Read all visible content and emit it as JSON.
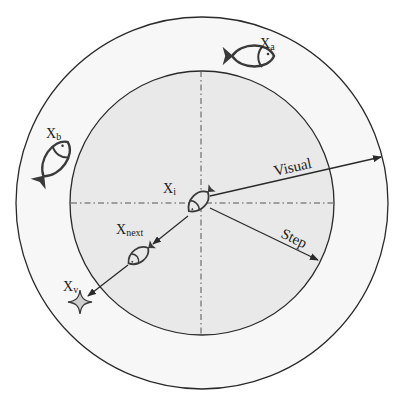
{
  "diagram": {
    "type": "fish-swarm-visual-step-diagram",
    "colors": {
      "background": "#ffffff",
      "outer_ring_fill": "#f7f7f7",
      "inner_disk_fill": "#e9e9e9",
      "stroke": "#2a2a2a",
      "star_fill": "#cfcfcf"
    },
    "circles": {
      "center": [
        202,
        203
      ],
      "outer_radius": 186,
      "inner_radius": 132
    },
    "labels": {
      "xa": {
        "main": "X",
        "sub": "a"
      },
      "xb": {
        "main": "X",
        "sub": "b"
      },
      "xi": {
        "main": "X",
        "sub": "i"
      },
      "xnext": {
        "main": "X",
        "sub": "next"
      },
      "xv": {
        "main": "X",
        "sub": "v"
      },
      "visual": "Visual",
      "step": "Step"
    },
    "fish": [
      {
        "id": "fish-xa",
        "label": "Xa"
      },
      {
        "id": "fish-xb",
        "label": "Xb"
      },
      {
        "id": "fish-xi",
        "label": "Xi"
      },
      {
        "id": "fish-xnext",
        "label": "Xnext"
      }
    ],
    "star": {
      "label": "Xv"
    }
  }
}
